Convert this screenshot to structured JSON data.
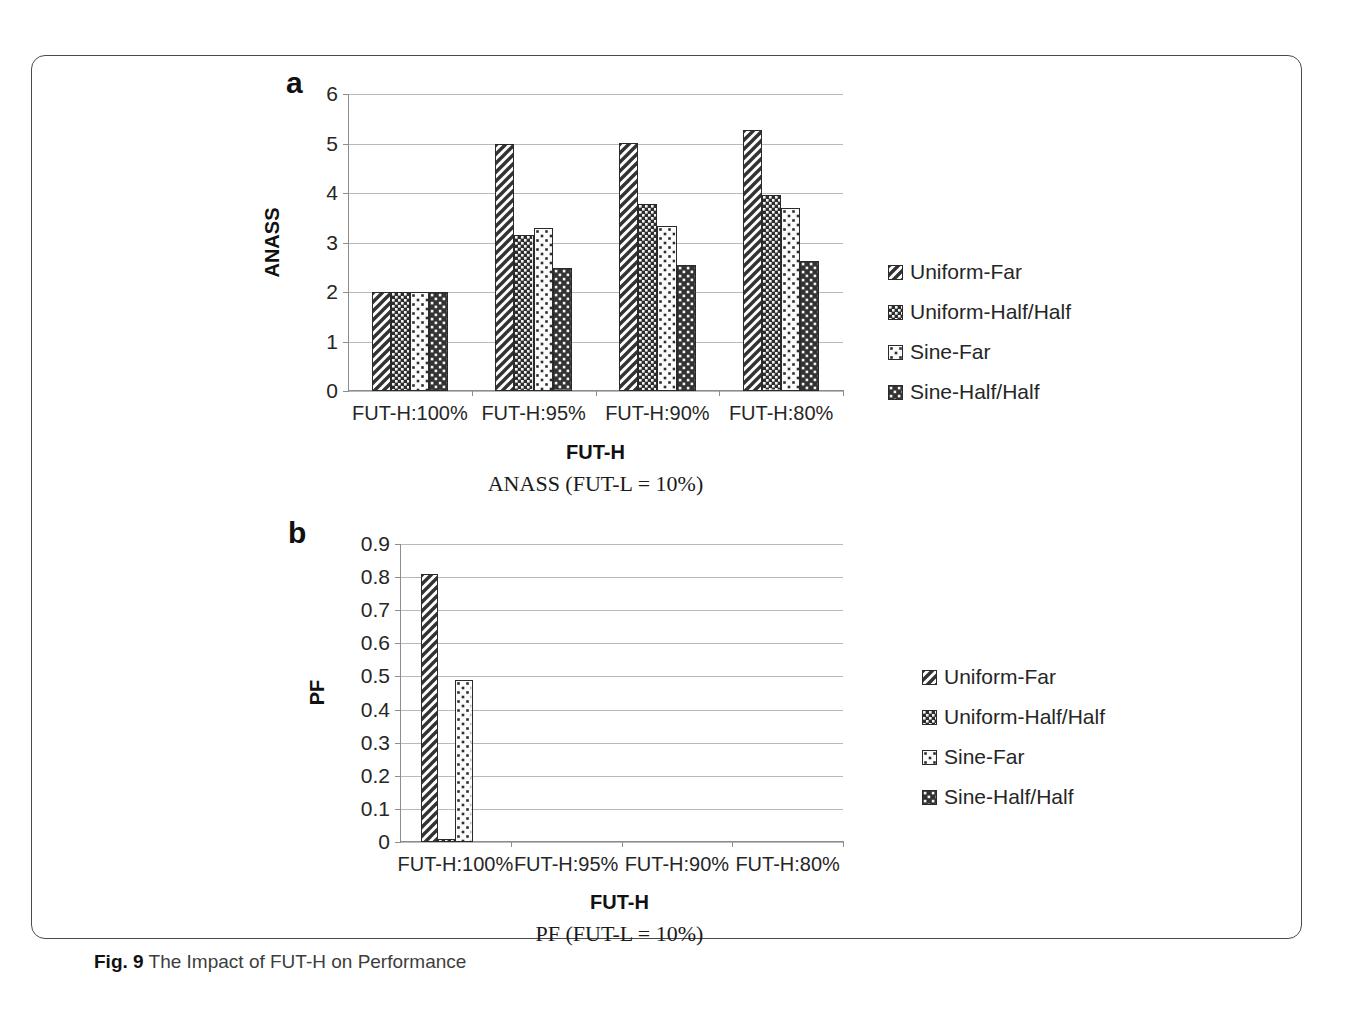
{
  "figure": {
    "caption_bold": "Fig. 9",
    "caption_text": "The Impact of FUT-H on Performance"
  },
  "panel_a": {
    "letter": "a",
    "subtitle": "ANASS (FUT-L = 10%)"
  },
  "panel_b": {
    "letter": "b",
    "subtitle": "PF (FUT-L = 10%)"
  },
  "legend": {
    "items": [
      {
        "label": "Uniform-Far",
        "pattern": "diagonal-stripes",
        "color": "#3a3a3a"
      },
      {
        "label": "Uniform-Half/Half",
        "pattern": "dense-dark-check",
        "color": "#2a2a2a"
      },
      {
        "label": "Sine-Far",
        "pattern": "sparse-light-dots",
        "color": "#f2f2f2"
      },
      {
        "label": "Sine-Half/Half",
        "pattern": "medium-dark-check",
        "color": "#333333"
      }
    ]
  },
  "chart_data": [
    {
      "type": "bar",
      "id": "anass",
      "title": "ANASS (FUT-L = 10%)",
      "xlabel": "FUT-H",
      "ylabel": "ANASS",
      "ylim": [
        0,
        6
      ],
      "yticks": [
        "0",
        "1",
        "2",
        "3",
        "4",
        "5",
        "6"
      ],
      "ytick_values": [
        0,
        1,
        2,
        3,
        4,
        5,
        6
      ],
      "grid": true,
      "legend_position": "right",
      "categories": [
        "FUT-H:100%",
        "FUT-H:95%",
        "FUT-H:90%",
        "FUT-H:80%"
      ],
      "series": [
        {
          "name": "Uniform-Far",
          "values": [
            2.0,
            5.0,
            5.02,
            5.28
          ]
        },
        {
          "name": "Uniform-Half/Half",
          "values": [
            2.0,
            3.15,
            3.78,
            3.95
          ]
        },
        {
          "name": "Sine-Far",
          "values": [
            2.0,
            3.3,
            3.33,
            3.7
          ]
        },
        {
          "name": "Sine-Half/Half",
          "values": [
            2.0,
            2.48,
            2.55,
            2.63
          ]
        }
      ]
    },
    {
      "type": "bar",
      "id": "pf",
      "title": "PF (FUT-L = 10%)",
      "xlabel": "FUT-H",
      "ylabel": "PF",
      "ylim": [
        0,
        0.9
      ],
      "yticks": [
        "0",
        "0.1",
        "0.2",
        "0.3",
        "0.4",
        "0.5",
        "0.6",
        "0.7",
        "0.8",
        "0.9"
      ],
      "ytick_values": [
        0,
        0.1,
        0.2,
        0.3,
        0.4,
        0.5,
        0.6,
        0.7,
        0.8,
        0.9
      ],
      "grid": true,
      "legend_position": "right",
      "categories": [
        "FUT-H:100%",
        "FUT-H:95%",
        "FUT-H:90%",
        "FUT-H:80%"
      ],
      "series": [
        {
          "name": "Uniform-Far",
          "values": [
            0.81,
            0,
            0,
            0
          ]
        },
        {
          "name": "Uniform-Half/Half",
          "values": [
            0.01,
            0,
            0,
            0
          ]
        },
        {
          "name": "Sine-Far",
          "values": [
            0.49,
            0,
            0,
            0
          ]
        },
        {
          "name": "Sine-Half/Half",
          "values": [
            0,
            0,
            0,
            0
          ]
        }
      ]
    }
  ]
}
